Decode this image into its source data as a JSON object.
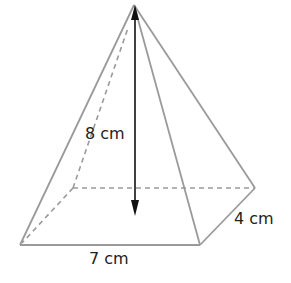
{
  "diagram": {
    "type": "rectangular-pyramid",
    "labels": {
      "height": "8 cm",
      "length": "7 cm",
      "width": "4 cm"
    },
    "colors": {
      "edge": "#9a9a9a",
      "arrow": "#111111",
      "text": "#222222"
    }
  }
}
